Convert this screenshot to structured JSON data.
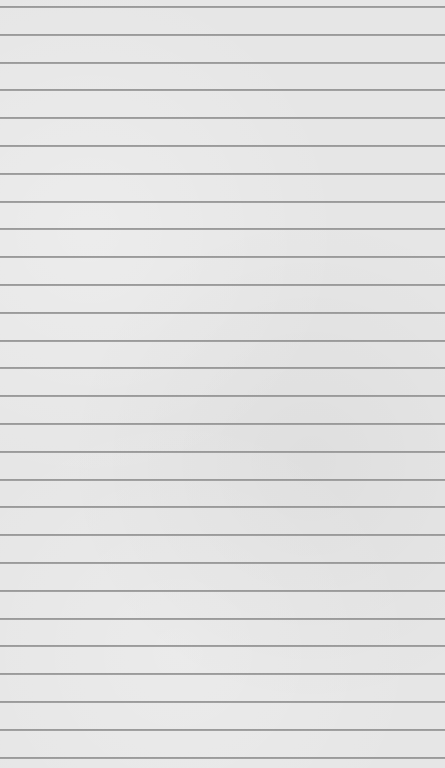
{
  "paper": {
    "background_color": "#e6e6e6",
    "line_color": "#8a8a8a",
    "line_count": 28,
    "first_line_y": 7,
    "line_spacing": 27.8,
    "text": ""
  }
}
